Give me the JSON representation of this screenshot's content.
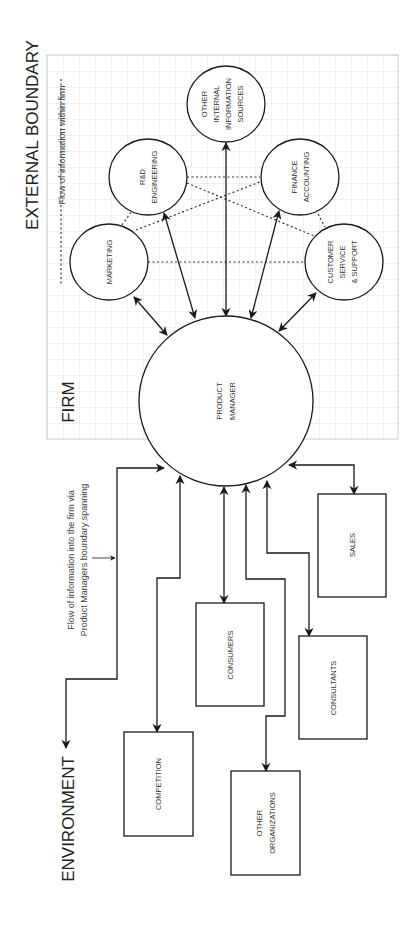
{
  "title_labels": {
    "external_boundary": "EXTERNAL BOUNDARY",
    "firm": "FIRM",
    "environment": "ENVIRONMENT"
  },
  "legend": {
    "internal_flow": "Flow of information within firm",
    "boundary_flow_line1": "Flow of information into the firm via",
    "boundary_flow_line2": "Product Managers boundary spanning"
  },
  "center_node": {
    "line1": "PRODUCT",
    "line2": "MANAGER"
  },
  "internal_nodes": {
    "marketing": {
      "line1": "MARKETING"
    },
    "rd": {
      "line1": "R&D",
      "line2": "ENGINEERING"
    },
    "other_internal": {
      "line1": "OTHER",
      "line2": "INTERNAL",
      "line3": "INFORMATION",
      "line4": "SOURCES"
    },
    "finance": {
      "line1": "FINANCE",
      "line2": "ACCOUNTING"
    },
    "customer_service": {
      "line1": "CUSTOMER",
      "line2": "SERVICE",
      "line3": "& SUPPORT"
    }
  },
  "external_nodes": {
    "competition": {
      "line1": "COMPETITION"
    },
    "consumers": {
      "line1": "CONSUMERS"
    },
    "other_orgs": {
      "line1": "OTHER",
      "line2": "ORGANIZATIONS"
    },
    "consultants": {
      "line1": "CONSULTANTS"
    },
    "sales": {
      "line1": "SALES"
    }
  },
  "colors": {
    "stroke": "#222222",
    "grid": "#d9d9d9",
    "grid_border": "#cccccc",
    "background": "#ffffff"
  }
}
